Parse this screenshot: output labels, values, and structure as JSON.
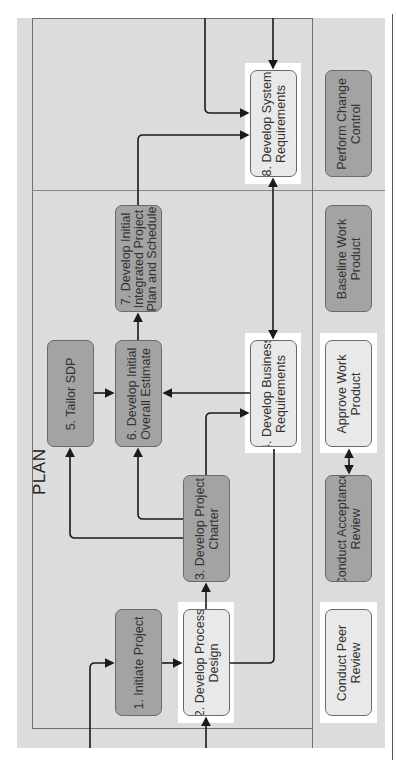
{
  "diagram": {
    "orientation": "rotated-90-ccw",
    "lane_title": "PLAN",
    "process_steps": [
      {
        "id": 1,
        "label": "1. Initiate Project",
        "style": "dark"
      },
      {
        "id": 2,
        "label": "2. Develop Process\nDesign",
        "style": "light"
      },
      {
        "id": 3,
        "label": "3. Develop Project\nCharter",
        "style": "dark"
      },
      {
        "id": 4,
        "label": "4. Develop Business\nRequirements",
        "style": "light"
      },
      {
        "id": 5,
        "label": "5. Tailor SDP",
        "style": "dark"
      },
      {
        "id": 6,
        "label": "6. Develop Initial\nOverall Estimate",
        "style": "dark"
      },
      {
        "id": 7,
        "label": "7. Develop Initial\nIntegrated Project\nPlan and Schedule",
        "style": "dark"
      },
      {
        "id": 8,
        "label": "8. Develop System\nRequirements",
        "style": "light"
      }
    ],
    "support_steps": [
      {
        "label": "Conduct Peer\nReview",
        "style": "light"
      },
      {
        "label": "Conduct Acceptance\nReview",
        "style": "dark"
      },
      {
        "label": "Approve Work\nProduct",
        "style": "light"
      },
      {
        "label": "Baseline Work\nProduct",
        "style": "dark"
      },
      {
        "label": "Perform Change\nControl",
        "style": "dark"
      }
    ],
    "connections": [
      {
        "from": "external",
        "to": 1
      },
      {
        "from": "external",
        "to": 2
      },
      {
        "from": 1,
        "to": 2
      },
      {
        "from": 2,
        "to": 3
      },
      {
        "from": 2,
        "to": 8
      },
      {
        "from": 3,
        "to": 5
      },
      {
        "from": 3,
        "to": 6
      },
      {
        "from": 3,
        "to": 4
      },
      {
        "from": 4,
        "to": 6
      },
      {
        "from": 4,
        "to": 8,
        "bidirectional": true
      },
      {
        "from": 5,
        "to": 6
      },
      {
        "from": 6,
        "to": 7
      },
      {
        "from": 7,
        "to": 8
      },
      {
        "from": "external",
        "to": 8
      },
      {
        "from": "Conduct Acceptance Review",
        "to": "Approve Work Product",
        "bidirectional": true
      }
    ],
    "colors": {
      "background": "#dcdcdc",
      "dark_box": "#a3a3a3",
      "light_box": "#e9e9e9",
      "highlight": "#ffffff",
      "line": "#1a1a1a"
    }
  }
}
